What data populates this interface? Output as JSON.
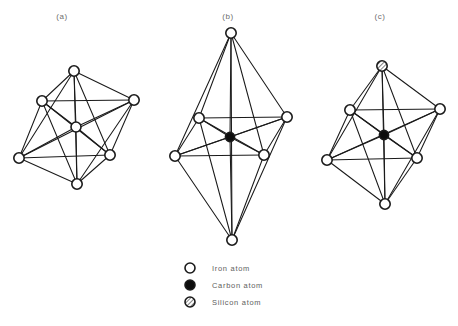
{
  "figure": {
    "background_color": "#ffffff",
    "line_color": "#1a1a1a",
    "panels": [
      {
        "id": "a",
        "label": "(a)",
        "label_x": 62,
        "label_y": 12,
        "description": "regular octahedron of iron atoms with central iron atom",
        "center": {
          "x": 76,
          "y": 127,
          "type": "iron"
        },
        "vertices": [
          {
            "name": "top",
            "x": 74,
            "y": 71,
            "type": "iron"
          },
          {
            "name": "upper-left",
            "x": 42,
            "y": 101,
            "type": "iron"
          },
          {
            "name": "upper-right",
            "x": 134,
            "y": 100,
            "type": "iron"
          },
          {
            "name": "lower-left",
            "x": 19,
            "y": 158,
            "type": "iron"
          },
          {
            "name": "lower-right",
            "x": 110,
            "y": 155,
            "type": "iron"
          },
          {
            "name": "bottom",
            "x": 77,
            "y": 184,
            "type": "iron"
          }
        ]
      },
      {
        "id": "b",
        "label": "(b)",
        "label_x": 228,
        "label_y": 12,
        "description": "elongated octahedron of iron atoms with central carbon atom",
        "center": {
          "x": 230,
          "y": 137,
          "type": "carbon"
        },
        "vertices": [
          {
            "name": "top",
            "x": 231,
            "y": 33,
            "type": "iron"
          },
          {
            "name": "upper-left",
            "x": 199,
            "y": 118,
            "type": "iron"
          },
          {
            "name": "upper-right",
            "x": 287,
            "y": 117,
            "type": "iron"
          },
          {
            "name": "lower-left",
            "x": 175,
            "y": 156,
            "type": "iron"
          },
          {
            "name": "lower-right",
            "x": 264,
            "y": 155,
            "type": "iron"
          },
          {
            "name": "bottom",
            "x": 232,
            "y": 240,
            "type": "iron"
          }
        ]
      },
      {
        "id": "c",
        "label": "(c)",
        "label_x": 380,
        "label_y": 12,
        "description": "octahedron with silicon atom at top vertex, iron atoms elsewhere and central carbon atom",
        "center": {
          "x": 384,
          "y": 135,
          "type": "carbon"
        },
        "vertices": [
          {
            "name": "top",
            "x": 382,
            "y": 66,
            "type": "silicon"
          },
          {
            "name": "upper-left",
            "x": 350,
            "y": 110,
            "type": "iron"
          },
          {
            "name": "upper-right",
            "x": 440,
            "y": 109,
            "type": "iron"
          },
          {
            "name": "lower-left",
            "x": 327,
            "y": 160,
            "type": "iron"
          },
          {
            "name": "lower-right",
            "x": 417,
            "y": 158,
            "type": "iron"
          },
          {
            "name": "bottom",
            "x": 385,
            "y": 204,
            "type": "iron"
          }
        ]
      }
    ]
  },
  "legend": {
    "x": 190,
    "y": 268,
    "row_spacing": 17,
    "text_offset_x": 22,
    "items": [
      {
        "symbol": "open-circle",
        "icon": "iron-atom-icon",
        "label": "Iron  atom"
      },
      {
        "symbol": "filled-circle",
        "icon": "carbon-atom-icon",
        "label": "Carbon  atom"
      },
      {
        "symbol": "hatched-circle",
        "icon": "silicon-atom-icon",
        "label": "Silicon  atom"
      }
    ]
  }
}
